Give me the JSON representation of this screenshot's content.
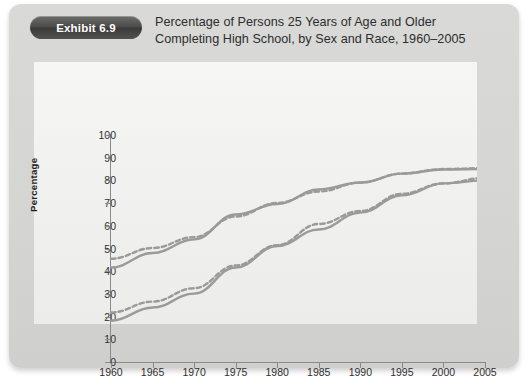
{
  "exhibit": {
    "badge_label": "Exhibit 6.9"
  },
  "title": {
    "line1": "Percentage of Persons 25 Years of Age and Older",
    "line2": "Completing High School, by Sex and Race, 1960–2005"
  },
  "colors": {
    "card_background": "#d6d6d4",
    "plot_background": "#f1f1ef",
    "badge_background": "#4a4a48",
    "badge_text": "#ffffff",
    "axis": "#8a8a88",
    "line_gray": "#9a9a98",
    "text": "#2d2d2d"
  },
  "chart_data": {
    "type": "line",
    "title": "Percentage of Persons 25 Years of Age and Older Completing High School, by Sex and Race, 1960–2005",
    "xlabel": "",
    "ylabel": "Percentage",
    "xlim": [
      1960,
      2005
    ],
    "ylim": [
      0,
      100
    ],
    "grid": false,
    "legend_position": "bottom-center",
    "x": [
      1960,
      1965,
      1970,
      1975,
      1980,
      1985,
      1990,
      1995,
      2000,
      2005
    ],
    "xticks": [
      "1960",
      "1965",
      "1970",
      "1975",
      "1980",
      "1985",
      "1990",
      "1995",
      "2000",
      "2005"
    ],
    "yticks": [
      "0",
      "10",
      "20",
      "30",
      "40",
      "50",
      "60",
      "70",
      "80",
      "90",
      "100"
    ],
    "series": [
      {
        "name": "Black Males",
        "style": "solid",
        "color": "#9a9a98",
        "values": [
          18.2,
          24.0,
          30.1,
          41.6,
          51.1,
          58.4,
          65.8,
          73.4,
          78.7,
          80.0
        ]
      },
      {
        "name": "White Males",
        "style": "solid",
        "color": "#9a9a98",
        "values": [
          41.6,
          48.0,
          54.0,
          65.0,
          69.6,
          76.0,
          79.1,
          83.0,
          84.8,
          85.0
        ]
      },
      {
        "name": "Black Females",
        "style": "dashed",
        "color": "#9a9a98",
        "values": [
          21.8,
          26.6,
          32.5,
          42.5,
          51.5,
          60.8,
          66.5,
          74.1,
          78.7,
          81.1
        ]
      },
      {
        "name": "White Females",
        "style": "dashed",
        "color": "#9a9a98",
        "values": [
          45.5,
          50.2,
          55.0,
          64.1,
          70.1,
          75.1,
          79.0,
          83.0,
          85.0,
          85.4
        ]
      }
    ]
  },
  "legend": {
    "entries": [
      {
        "label": "Black Males",
        "style": "solid"
      },
      {
        "label": "Black Females",
        "style": "dashed"
      },
      {
        "label": "White Males",
        "style": "solid"
      },
      {
        "label": "White Females",
        "style": "dashed"
      }
    ]
  }
}
